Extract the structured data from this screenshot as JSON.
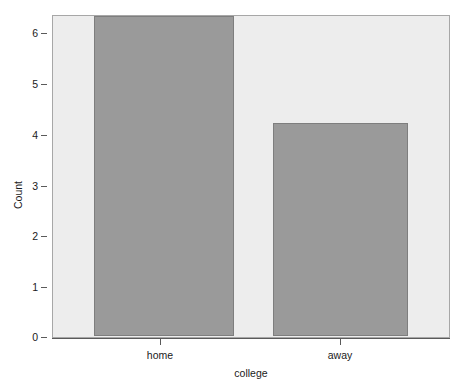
{
  "chart_data": {
    "type": "bar",
    "title": "",
    "subtitle": "",
    "categories": [
      "home",
      "away"
    ],
    "values": [
      6,
      4
    ],
    "series": [
      {
        "name": "Count",
        "values": [
          6,
          4
        ]
      }
    ],
    "xlabel": "college",
    "ylabel": "Count",
    "ylim": [
      0,
      6
    ],
    "yticks": [
      "0",
      "1",
      "2",
      "3",
      "4",
      "5",
      "6"
    ],
    "ytick_values": [
      0,
      1,
      2,
      3,
      4,
      5,
      6
    ],
    "xticks": [
      "home",
      "away"
    ],
    "grid": false,
    "legend": false,
    "legend_position": "none",
    "annotations": [],
    "colors": {
      "bar_fill": "#9a9a9a",
      "bar_border": "#7e7e7e",
      "panel_background": "#ededed",
      "panel_border": "#a7a7a7",
      "figure_background": "#ffffff",
      "axis_line": "#5a5a5a",
      "text": "#1a1a1a"
    }
  }
}
